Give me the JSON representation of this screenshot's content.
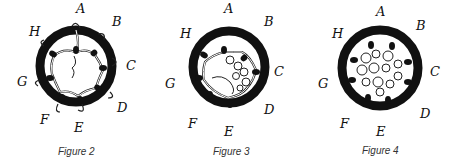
{
  "figures": [
    {
      "caption": "Figure 2",
      "stage": "web-sparse",
      "points": [
        "A",
        "B",
        "C",
        "D",
        "E",
        "F",
        "G",
        "H"
      ]
    },
    {
      "caption": "Figure 3",
      "stage": "web-partial-tangle",
      "points": [
        "A",
        "B",
        "C",
        "D",
        "E",
        "F",
        "G",
        "H"
      ]
    },
    {
      "caption": "Figure 4",
      "stage": "web-dense-tangle",
      "points": [
        "A",
        "B",
        "C",
        "D",
        "E",
        "F",
        "G",
        "H"
      ]
    }
  ],
  "colors": {
    "ring": "#111111",
    "thread": "#ffffff",
    "thread_outline": "#222222",
    "bead": "#111111"
  }
}
